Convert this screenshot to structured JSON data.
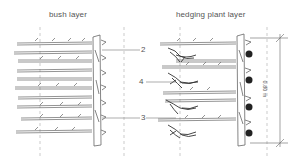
{
  "panels": [
    {
      "title": "bush layer"
    },
    {
      "title": "hedging plant layer"
    }
  ],
  "callouts": [
    {
      "number": "2"
    },
    {
      "number": "4"
    },
    {
      "number": "3"
    }
  ],
  "dimension": {
    "label": "0.80 m"
  },
  "colors": {
    "line": "#666666",
    "dark": "#333333",
    "dash": "#999999",
    "text": "#555555"
  }
}
